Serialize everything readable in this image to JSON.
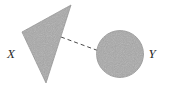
{
  "figure": {
    "name": "two-sets-connected-diagram",
    "background_color": "#ffffff",
    "width": 172,
    "height": 93
  },
  "shapes": {
    "triangle": {
      "label": "X",
      "kind": "triangle",
      "fill_color": "#a9a9a9",
      "stroke_color": "#8f8f8f",
      "points": "71,5 22,32 46,83",
      "vertices": [
        {
          "x": 71,
          "y": 5
        },
        {
          "x": 22,
          "y": 32
        },
        {
          "x": 46,
          "y": 83
        }
      ]
    },
    "circle": {
      "label": "Y",
      "kind": "circle",
      "fill_color": "#a9a9a9",
      "stroke_color": "#8f8f8f",
      "center_x": 120,
      "center_y": 54,
      "radius": 23.5
    }
  },
  "connector": {
    "name": "dashed-connector",
    "kind": "dashed-line",
    "color": "#4a4a4a",
    "dash_pattern": "4 3",
    "x1": 61,
    "y1": 37,
    "x2": 99,
    "y2": 51
  },
  "labels": {
    "left": {
      "text": "X",
      "x": 11,
      "y": 58
    },
    "right": {
      "text": "Y",
      "x": 152,
      "y": 58
    }
  }
}
